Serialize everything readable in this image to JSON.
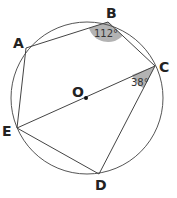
{
  "diagram": {
    "type": "inscribed-pentagon",
    "circle": {
      "cx": 87,
      "cy": 98,
      "r": 76,
      "stroke": "#555555"
    },
    "center": {
      "label": "O",
      "x": 86,
      "y": 98
    },
    "points": {
      "A": {
        "x": 26,
        "y": 48
      },
      "B": {
        "x": 108,
        "y": 22
      },
      "C": {
        "x": 155,
        "y": 66
      },
      "D": {
        "x": 99,
        "y": 174
      },
      "E": {
        "x": 17,
        "y": 128
      }
    },
    "labels": {
      "A": "A",
      "B": "B",
      "C": "C",
      "D": "D",
      "E": "E",
      "O": "O"
    },
    "angles": {
      "B": "112°",
      "C": "38°"
    },
    "angle_fill": "#b3b3b3",
    "line_color": "#444444"
  }
}
